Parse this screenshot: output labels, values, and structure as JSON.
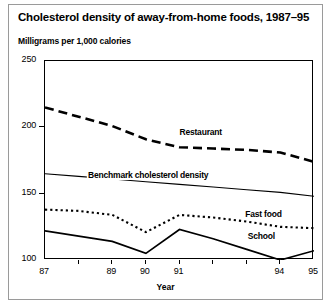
{
  "figure": {
    "title": "Cholesterol density of away-from-home foods, 1987–95",
    "subtitle": "Milligrams per 1,000 calories",
    "xaxis_title": "Year"
  },
  "chart_data": {
    "type": "line",
    "title": "Cholesterol density of away-from-home foods, 1987–95",
    "subtitle": "Milligrams per 1,000 calories",
    "xlabel": "Year",
    "ylabel": "Milligrams per 1,000 calories",
    "x": [
      1987,
      1988,
      1989,
      1990,
      1991,
      1992,
      1993,
      1994,
      1995
    ],
    "xtick_labels": [
      "87",
      "",
      "89",
      "90",
      "91",
      "",
      "",
      "94",
      "95"
    ],
    "ytick_labels": [
      "100",
      "150",
      "200",
      "250"
    ],
    "yticks": [
      100,
      150,
      200,
      250
    ],
    "ylim": [
      100,
      250
    ],
    "xlim": [
      1987,
      1995
    ],
    "grid": false,
    "legend": "inline-labels",
    "series": [
      {
        "name": "Restaurant",
        "style": "thick-dashed",
        "color": "#000000",
        "label_x": 1991,
        "label_y": 196,
        "values": [
          215,
          208,
          201,
          191,
          185,
          184,
          183,
          181,
          174
        ]
      },
      {
        "name": "Benchmark cholesterol density",
        "style": "thin-solid",
        "color": "#000000",
        "label_x": 1990.1,
        "label_y": 163,
        "values": [
          165,
          163,
          161,
          159,
          157,
          155,
          153,
          151,
          148
        ]
      },
      {
        "name": "Fast food",
        "style": "dotted",
        "color": "#000000",
        "label_x": 1994.1,
        "label_y": 134,
        "values": [
          138,
          137,
          134,
          121,
          134,
          132,
          129,
          125,
          124
        ]
      },
      {
        "name": "School",
        "style": "medium-solid",
        "color": "#000000",
        "label_x": 1993.9,
        "label_y": 117,
        "values": [
          122,
          118,
          114,
          105,
          123,
          116,
          108,
          100,
          107
        ]
      }
    ]
  }
}
